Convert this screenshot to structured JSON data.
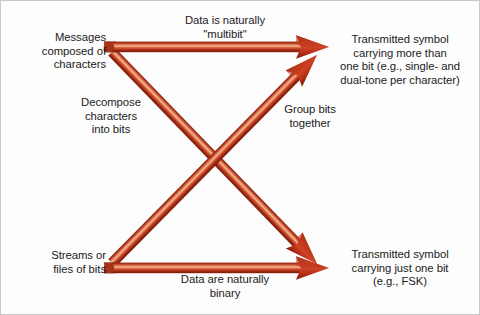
{
  "diagram": {
    "background_color": "#fdfdfd",
    "border_color": "#c9c9c9",
    "arrow_colors": {
      "edge_dark": "#7d1a0c",
      "body_mid": "#c5411f",
      "highlight": "#f2a184",
      "shadow": "#8f2410",
      "head": "#c3301a"
    }
  },
  "labels": {
    "messages_composed": "Messages\ncomposed of\ncharacters",
    "decompose": "Decompose\ncharacters\ninto bits",
    "streams_files": "Streams or\nfiles of bits",
    "data_multibit": "Data is naturally\n\"multibit\"",
    "data_binary": "Data are naturally\nbinary",
    "group_bits": "Group bits\ntogether",
    "transmitted_multibit": "Transmitted symbol\ncarrying more than\none bit (e.g., single- and\ndual-tone per character)",
    "transmitted_single": "Transmitted symbol\ncarrying just one bit\n(e.g., FSK)"
  },
  "arrows": [
    {
      "name": "messages-to-multibit-symbol",
      "from": "Messages composed of characters",
      "to": "Transmitted symbol carrying more than one bit",
      "path": "horizontal-top"
    },
    {
      "name": "messages-to-binary-symbol",
      "from": "Messages composed of characters",
      "to": "Transmitted symbol carrying just one bit",
      "path": "diagonal-down-right"
    },
    {
      "name": "streams-to-multibit-symbol",
      "from": "Streams or files of bits",
      "to": "Transmitted symbol carrying more than one bit",
      "path": "diagonal-up-right"
    },
    {
      "name": "streams-to-binary-symbol",
      "from": "Streams or files of bits",
      "to": "Transmitted symbol carrying just one bit",
      "path": "horizontal-bottom"
    }
  ]
}
